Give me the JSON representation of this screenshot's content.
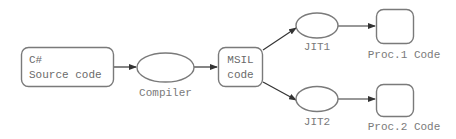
{
  "diagram": {
    "type": "flowchart",
    "colors": {
      "shape_stroke": "#7a7a7a",
      "edge": "#333333",
      "text": "#6a6a6a"
    },
    "nodes": {
      "source": {
        "shape": "rounded-rect",
        "line1": "C#",
        "line2": "Source code"
      },
      "compiler": {
        "shape": "ellipse",
        "label": "Compiler"
      },
      "msil": {
        "shape": "rounded-rect",
        "line1": "MSIL",
        "line2": "code"
      },
      "jit1": {
        "shape": "ellipse",
        "label": "JIT1"
      },
      "jit2": {
        "shape": "ellipse",
        "label": "JIT2"
      },
      "proc1": {
        "shape": "rounded-rect",
        "label": "Proc.1 Code"
      },
      "proc2": {
        "shape": "rounded-rect",
        "label": "Proc.2 Code"
      }
    },
    "edges": [
      {
        "from": "source",
        "to": "compiler"
      },
      {
        "from": "compiler",
        "to": "msil"
      },
      {
        "from": "msil",
        "to": "jit1"
      },
      {
        "from": "msil",
        "to": "jit2"
      },
      {
        "from": "jit1",
        "to": "proc1"
      },
      {
        "from": "jit2",
        "to": "proc2"
      }
    ]
  }
}
